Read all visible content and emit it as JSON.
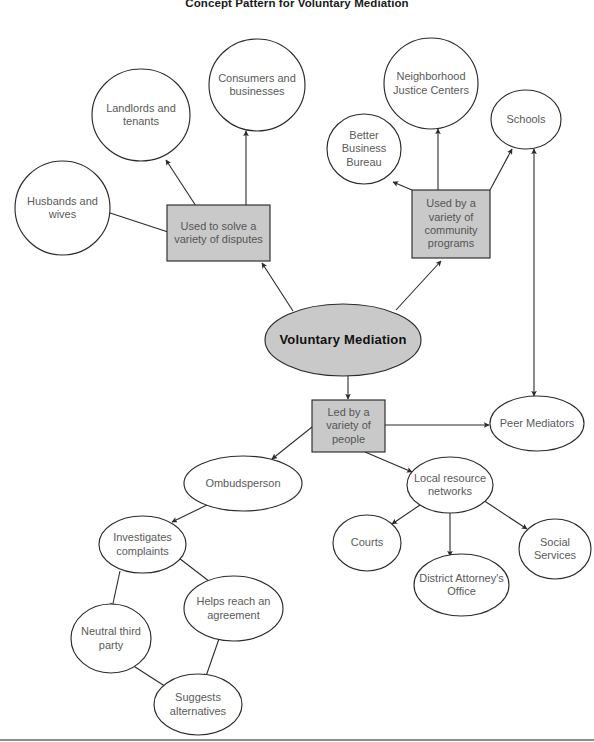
{
  "title": "Concept Pattern for Voluntary Mediation",
  "colors": {
    "shape_fill": "#c9c9c9",
    "node_fill": "#ffffff",
    "stroke": "#2b2b2b",
    "text": "#5a5a5a",
    "central_text": "#111111"
  },
  "central": {
    "id": "voluntary-mediation",
    "label": "Voluntary Mediation",
    "shape": "ellipse",
    "x": 265,
    "y": 304,
    "w": 156,
    "h": 72
  },
  "process_boxes": [
    {
      "id": "used-to-solve-disputes",
      "label": "Used to solve a variety of disputes",
      "shape": "rect",
      "x": 167,
      "y": 205,
      "w": 103,
      "h": 56
    },
    {
      "id": "used-by-community-programs",
      "label": "Used by a variety of community programs",
      "shape": "rect",
      "x": 412,
      "y": 190,
      "w": 78,
      "h": 68
    },
    {
      "id": "led-by-variety-of-people",
      "label": "Led by a variety of people",
      "shape": "rect",
      "x": 312,
      "y": 400,
      "w": 73,
      "h": 52
    }
  ],
  "nodes": [
    {
      "id": "husbands-and-wives",
      "label": "Husbands and wives",
      "shape": "ellipse",
      "x": 15,
      "y": 161,
      "w": 95,
      "h": 94
    },
    {
      "id": "landlords-and-tenants",
      "label": "Landlords and tenants",
      "shape": "ellipse",
      "x": 92,
      "y": 69,
      "w": 98,
      "h": 92
    },
    {
      "id": "consumers-and-businesses",
      "label": "Consumers and businesses",
      "shape": "ellipse",
      "x": 209,
      "y": 39,
      "w": 96,
      "h": 92
    },
    {
      "id": "better-business-bureau",
      "label": "Better Business Bureau",
      "shape": "ellipse",
      "x": 327,
      "y": 114,
      "w": 74,
      "h": 70
    },
    {
      "id": "neighborhood-justice-centers",
      "label": "Neighborhood Justice Centers",
      "shape": "ellipse",
      "x": 384,
      "y": 38,
      "w": 94,
      "h": 91
    },
    {
      "id": "schools",
      "label": "Schools",
      "shape": "ellipse",
      "x": 491,
      "y": 90,
      "w": 70,
      "h": 59
    },
    {
      "id": "peer-mediators",
      "label": "Peer Mediators",
      "shape": "ellipse",
      "x": 490,
      "y": 396,
      "w": 94,
      "h": 55
    },
    {
      "id": "ombudsperson",
      "label": "Ombudsperson",
      "shape": "ellipse",
      "x": 184,
      "y": 456,
      "w": 118,
      "h": 55
    },
    {
      "id": "investigates-complaints",
      "label": "Investigates complaints",
      "shape": "ellipse",
      "x": 99,
      "y": 516,
      "w": 87,
      "h": 57
    },
    {
      "id": "helps-reach-an-agreement",
      "label": "Helps reach an agreement",
      "shape": "ellipse",
      "x": 184,
      "y": 576,
      "w": 99,
      "h": 65
    },
    {
      "id": "neutral-third-party",
      "label": "Neutral third party",
      "shape": "ellipse",
      "x": 71,
      "y": 604,
      "w": 80,
      "h": 69
    },
    {
      "id": "suggests-alternatives",
      "label": "Suggests alternatives",
      "shape": "ellipse",
      "x": 154,
      "y": 674,
      "w": 88,
      "h": 61
    },
    {
      "id": "local-resource-networks",
      "label": "Local resource networks",
      "shape": "ellipse",
      "x": 407,
      "y": 457,
      "w": 86,
      "h": 56
    },
    {
      "id": "courts",
      "label": "Courts",
      "shape": "ellipse",
      "x": 333,
      "y": 515,
      "w": 68,
      "h": 56
    },
    {
      "id": "district-attorneys-office",
      "label": "District Attorney's Office",
      "shape": "ellipse",
      "x": 414,
      "y": 554,
      "w": 95,
      "h": 62
    },
    {
      "id": "social-services",
      "label": "Social Services",
      "shape": "ellipse",
      "x": 519,
      "y": 519,
      "w": 72,
      "h": 60
    }
  ],
  "edges": [
    {
      "id": "edge-disputes-to-husbands",
      "from": "used-to-solve-disputes",
      "to": "husbands-and-wives",
      "x1": 168,
      "y1": 232,
      "x2": 104,
      "y2": 211,
      "heads": "end"
    },
    {
      "id": "edge-disputes-to-landlords",
      "from": "used-to-solve-disputes",
      "to": "landlords-and-tenants",
      "x1": 196,
      "y1": 206,
      "x2": 166,
      "y2": 160,
      "heads": "end"
    },
    {
      "id": "edge-disputes-to-consumers",
      "from": "used-to-solve-disputes",
      "to": "consumers-and-businesses",
      "x1": 246,
      "y1": 205,
      "x2": 246,
      "y2": 131,
      "heads": "end"
    },
    {
      "id": "edge-central-to-disputes",
      "from": "voluntary-mediation",
      "to": "used-to-solve-disputes",
      "x1": 293,
      "y1": 311,
      "x2": 262,
      "y2": 263,
      "heads": "end"
    },
    {
      "id": "edge-central-to-community",
      "from": "voluntary-mediation",
      "to": "used-by-community-programs",
      "x1": 396,
      "y1": 310,
      "x2": 441,
      "y2": 261,
      "heads": "end"
    },
    {
      "id": "edge-community-to-bbb",
      "from": "used-by-community-programs",
      "to": "better-business-bureau",
      "x1": 412,
      "y1": 190,
      "x2": 393,
      "y2": 182,
      "heads": "end"
    },
    {
      "id": "edge-community-to-njc",
      "from": "used-by-community-programs",
      "to": "neighborhood-justice-centers",
      "x1": 438,
      "y1": 190,
      "x2": 438,
      "y2": 129,
      "heads": "end"
    },
    {
      "id": "edge-community-to-schools",
      "from": "used-by-community-programs",
      "to": "schools",
      "x1": 490,
      "y1": 190,
      "x2": 512,
      "y2": 149,
      "heads": "end"
    },
    {
      "id": "edge-schools-peer-mediators",
      "from": "schools",
      "to": "peer-mediators",
      "x1": 534,
      "y1": 149,
      "x2": 534,
      "y2": 396,
      "heads": "both"
    },
    {
      "id": "edge-central-to-led-by",
      "from": "voluntary-mediation",
      "to": "led-by-variety-of-people",
      "x1": 348,
      "y1": 376,
      "x2": 348,
      "y2": 399,
      "heads": "end"
    },
    {
      "id": "edge-led-by-to-peer-mediators",
      "from": "led-by-variety-of-people",
      "to": "peer-mediators",
      "x1": 385,
      "y1": 425,
      "x2": 489,
      "y2": 425,
      "heads": "end"
    },
    {
      "id": "edge-led-by-to-ombudsperson",
      "from": "led-by-variety-of-people",
      "to": "ombudsperson",
      "x1": 312,
      "y1": 427,
      "x2": 272,
      "y2": 459,
      "heads": "end"
    },
    {
      "id": "edge-led-by-to-local-resource",
      "from": "led-by-variety-of-people",
      "to": "local-resource-networks",
      "x1": 365,
      "y1": 452,
      "x2": 412,
      "y2": 472,
      "heads": "end"
    },
    {
      "id": "edge-ombudsperson-to-investigates",
      "from": "ombudsperson",
      "to": "investigates-complaints",
      "x1": 209,
      "y1": 504,
      "x2": 172,
      "y2": 522,
      "heads": "end"
    },
    {
      "id": "edge-investigates-to-neutral",
      "from": "investigates-complaints",
      "to": "neutral-third-party",
      "x1": 120,
      "y1": 571,
      "x2": 112,
      "y2": 608,
      "heads": "end"
    },
    {
      "id": "edge-investigates-to-helps",
      "from": "investigates-complaints",
      "to": "helps-reach-an-agreement",
      "x1": 175,
      "y1": 555,
      "x2": 214,
      "y2": 585,
      "heads": "end"
    },
    {
      "id": "edge-neutral-to-suggests",
      "from": "neutral-third-party",
      "to": "suggests-alternatives",
      "x1": 132,
      "y1": 665,
      "x2": 174,
      "y2": 692,
      "heads": "end"
    },
    {
      "id": "edge-helps-to-suggests",
      "from": "helps-reach-an-agreement",
      "to": "suggests-alternatives",
      "x1": 220,
      "y1": 636,
      "x2": 205,
      "y2": 679,
      "heads": "end"
    },
    {
      "id": "edge-local-to-courts",
      "from": "local-resource-networks",
      "to": "courts",
      "x1": 420,
      "y1": 505,
      "x2": 392,
      "y2": 524,
      "heads": "end"
    },
    {
      "id": "edge-local-to-district-attorney",
      "from": "local-resource-networks",
      "to": "district-attorneys-office",
      "x1": 450,
      "y1": 513,
      "x2": 450,
      "y2": 556,
      "heads": "end"
    },
    {
      "id": "edge-local-to-social-services",
      "from": "local-resource-networks",
      "to": "social-services",
      "x1": 483,
      "y1": 500,
      "x2": 527,
      "y2": 529,
      "heads": "end"
    }
  ]
}
